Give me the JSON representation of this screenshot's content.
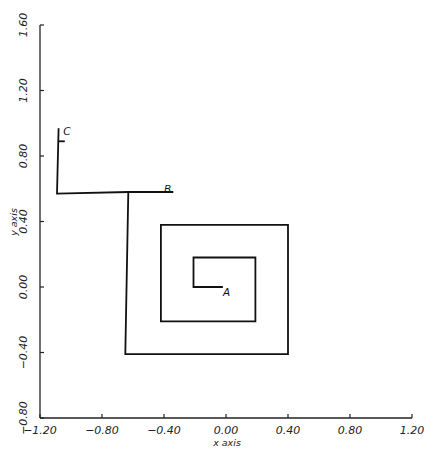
{
  "chart_data": {
    "type": "line",
    "title": "",
    "xlabel": "x axis",
    "ylabel": "y axis",
    "xlim": [
      -1.2,
      1.2
    ],
    "ylim": [
      -0.8,
      1.6
    ],
    "grid": false,
    "legend": null,
    "x_ticks": [
      "-1.20",
      "-0.80",
      "-0.40",
      "0.00",
      "0.40",
      "0.80",
      "1.20"
    ],
    "y_ticks": [
      "-0.80",
      "-0.40",
      "0.00",
      "0.40",
      "0.80",
      "1.20",
      "1.60"
    ],
    "series": [
      {
        "name": "square spiral path",
        "color": "#111111",
        "points": [
          [
            -0.02,
            0.0
          ],
          [
            -0.21,
            0.0
          ],
          [
            -0.21,
            0.18
          ],
          [
            0.19,
            0.18
          ],
          [
            0.19,
            -0.21
          ],
          [
            -0.42,
            -0.21
          ],
          [
            -0.42,
            0.38
          ],
          [
            0.4,
            0.38
          ],
          [
            0.4,
            -0.41
          ],
          [
            -0.65,
            -0.41
          ],
          [
            -0.63,
            0.58
          ],
          [
            -0.34,
            0.58
          ]
        ]
      },
      {
        "name": "branch to C",
        "color": "#111111",
        "points": [
          [
            -0.63,
            0.58
          ],
          [
            -1.09,
            0.57
          ],
          [
            -1.08,
            0.97
          ]
        ]
      },
      {
        "name": "C marker tick",
        "color": "#111111",
        "points": [
          [
            -1.08,
            0.89
          ],
          [
            -1.04,
            0.89
          ]
        ]
      }
    ],
    "annotations": [
      {
        "text": "A",
        "x": -0.02,
        "y": -0.03
      },
      {
        "text": "B",
        "x": -0.4,
        "y": 0.6
      },
      {
        "text": "C",
        "x": -1.05,
        "y": 0.95
      }
    ]
  }
}
